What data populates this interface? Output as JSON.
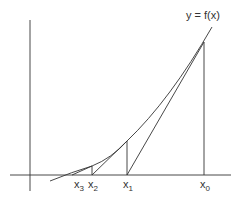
{
  "diagram": {
    "curve_label": "y = f(x)",
    "x_labels": [
      {
        "base": "x",
        "sub": "3"
      },
      {
        "base": "x",
        "sub": "2"
      },
      {
        "base": "x",
        "sub": "1"
      },
      {
        "base": "x",
        "sub": "0"
      }
    ]
  }
}
